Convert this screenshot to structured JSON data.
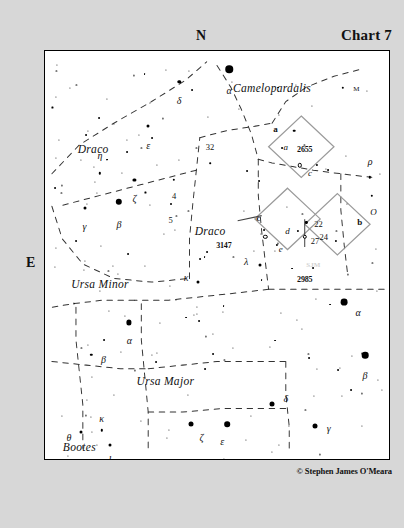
{
  "header": {
    "north_label": "N",
    "east_label": "E",
    "chart_title": "Chart 7"
  },
  "footer": {
    "copyright": "© Stephen James O'Meara"
  },
  "chart_data": {
    "type": "scatter",
    "title": "Chart 7",
    "subtitle": "",
    "xlabel": "",
    "ylabel": "",
    "grid": false,
    "legend": "none",
    "orientation": {
      "top": "N",
      "left": "E"
    },
    "constellations": [
      {
        "name": "Draco",
        "x": 14,
        "y": 24
      },
      {
        "name": "Camelopardalis",
        "x": 66,
        "y": 9
      },
      {
        "name": "Draco",
        "x": 48,
        "y": 44
      },
      {
        "name": "Ursa Minor",
        "x": 16,
        "y": 57
      },
      {
        "name": "Ursa Major",
        "x": 35,
        "y": 81
      },
      {
        "name": "Bootes",
        "x": 10,
        "y": 97
      }
    ],
    "stars": [
      {
        "label": "α",
        "x": 53.5,
        "y": 4.5,
        "mag": 7.5,
        "lx": 53.5,
        "ly": 9.5,
        "style": "greek"
      },
      {
        "label": "δ",
        "x": 39,
        "y": 7.5,
        "mag": 3.4,
        "lx": 39,
        "ly": 12.0,
        "style": "greek"
      },
      {
        "label": "M",
        "x": 86.5,
        "y": 9.0,
        "mag": 2.4,
        "lx": 90.5,
        "ly": 9.4,
        "style": "smallcap"
      },
      {
        "label": "ε",
        "x": 30,
        "y": 18.5,
        "mag": 3.0,
        "lx": 30,
        "ly": 23.0,
        "style": "greek"
      },
      {
        "label": "a",
        "x": 72.5,
        "y": 19.5,
        "mag": 2.6,
        "lx": 70.0,
        "ly": 23.5,
        "style": "ital"
      },
      {
        "label": "32",
        "x": 48,
        "y": 27.5,
        "mag": 1.6,
        "lx": 48,
        "ly": 23.5,
        "style": "num"
      },
      {
        "label": "η",
        "x": 16,
        "y": 30.0,
        "mag": 2.4,
        "lx": 16,
        "ly": 25.5,
        "style": "greek"
      },
      {
        "label": "ζ",
        "x": 26,
        "y": 31.5,
        "mag": 3.2,
        "lx": 26,
        "ly": 36.0,
        "style": "greek"
      },
      {
        "label": "4",
        "x": 37.5,
        "y": 31.5,
        "mag": 2.4,
        "lx": 37.5,
        "ly": 35.5,
        "style": "num"
      },
      {
        "label": "5",
        "x": 36.5,
        "y": 37.5,
        "mag": 2.0,
        "lx": 36.5,
        "ly": 41.5,
        "style": "num"
      },
      {
        "label": "γ",
        "x": 11.5,
        "y": 38.5,
        "mag": 3.0,
        "lx": 11.5,
        "ly": 43.0,
        "style": "greek"
      },
      {
        "label": "β",
        "x": 21.5,
        "y": 37.0,
        "mag": 6.4,
        "lx": 21.5,
        "ly": 42.5,
        "style": "greek"
      },
      {
        "label": "κ",
        "x": 44.5,
        "y": 56.5,
        "mag": 3.0,
        "lx": 41.0,
        "ly": 55.5,
        "style": "greek"
      },
      {
        "label": "λ",
        "x": 62.5,
        "y": 52.5,
        "mag": 3.0,
        "lx": 58.5,
        "ly": 51.5,
        "style": "greek"
      },
      {
        "label": "α",
        "x": 24.5,
        "y": 66.5,
        "mag": 5.2,
        "lx": 24.5,
        "ly": 70.8,
        "style": "greek"
      },
      {
        "label": "α",
        "x": 87,
        "y": 61.5,
        "mag": 6.8,
        "lx": 91.0,
        "ly": 64.0,
        "style": "greek"
      },
      {
        "label": "β",
        "x": 13.5,
        "y": 74.5,
        "mag": 2.4,
        "lx": 17.0,
        "ly": 75.5,
        "style": "greek"
      },
      {
        "label": "β",
        "x": 93,
        "y": 74.5,
        "mag": 6.6,
        "lx": 93.0,
        "ly": 79.5,
        "style": "greek"
      },
      {
        "label": "δ",
        "x": 66,
        "y": 86.5,
        "mag": 5.0,
        "lx": 70.0,
        "ly": 85.0,
        "style": "greek"
      },
      {
        "label": "ε",
        "x": 53,
        "y": 91.5,
        "mag": 5.6,
        "lx": 51.5,
        "ly": 95.5,
        "style": "greek"
      },
      {
        "label": "γ",
        "x": 78.5,
        "y": 92.0,
        "mag": 5.0,
        "lx": 82.5,
        "ly": 92.5,
        "style": "greek"
      },
      {
        "label": "ζ",
        "x": 42.5,
        "y": 91.5,
        "mag": 5.0,
        "lx": 45.5,
        "ly": 94.5,
        "style": "greek"
      },
      {
        "label": "θ",
        "x": 10.5,
        "y": 93.5,
        "mag": 3.0,
        "lx": 7.0,
        "ly": 94.5,
        "style": "greek"
      },
      {
        "label": "κ",
        "x": 16.5,
        "y": 93.0,
        "mag": 2.4,
        "lx": 16.5,
        "ly": 90.0,
        "style": "greek"
      },
      {
        "label": "ι",
        "x": 19.0,
        "y": 96.5,
        "mag": 3.0,
        "lx": 19.0,
        "ly": 99.5,
        "style": "greek"
      },
      {
        "label": "η",
        "x": 21.5,
        "y": 104.5,
        "mag": 5.2,
        "lx": 25.0,
        "ly": 106.0,
        "style": "greek"
      },
      {
        "label": "χ",
        "x": 82.5,
        "y": 104.0,
        "mag": 3.6,
        "lx": 86.5,
        "ly": 105.5,
        "style": "greek"
      },
      {
        "label": "ρ",
        "x": 94.5,
        "y": 31.0,
        "mag": 2.4,
        "lx": 94.5,
        "ly": 27.0,
        "style": "greek"
      },
      {
        "label": "O",
        "x": 95.0,
        "y": 35.5,
        "mag": 2.4,
        "lx": 95.5,
        "ly": 39.5,
        "style": "ital"
      }
    ],
    "detail_fields": [
      {
        "label": "a",
        "cx": 74.5,
        "cy": 26.5
      },
      {
        "label": "c",
        "cx": 70.5,
        "cy": 46.5
      },
      {
        "label": "b",
        "cx": 85.0,
        "cy": 48.0
      }
    ],
    "deep_sky_objects": [
      {
        "catalog": "2655",
        "x": 74.0,
        "y": 28.0,
        "lx": 75.5,
        "ly": 24.0
      },
      {
        "catalog": "3147",
        "x": 64.0,
        "y": 45.5,
        "lx": 52.0,
        "ly": 47.5
      },
      {
        "catalog": "2985",
        "x": 75.5,
        "y": 45.5,
        "lx": 75.5,
        "ly": 56.0
      }
    ],
    "field_stars": [
      {
        "label": "c",
        "x": 79.0,
        "y": 28.0,
        "lx": 77.0,
        "ly": 30.0,
        "style": "ital"
      },
      {
        "label": "d",
        "x": 73.5,
        "y": 44.0,
        "lx": 70.5,
        "ly": 44.0,
        "style": "ital"
      },
      {
        "label": "e",
        "x": 67.5,
        "y": 47.5,
        "lx": 68.5,
        "ly": 48.5,
        "style": "ital"
      },
      {
        "label": "22",
        "x": 76.0,
        "y": 42.0,
        "lx": 79.5,
        "ly": 42.5,
        "style": "num"
      },
      {
        "label": "27",
        "x": 75.5,
        "y": 45.5,
        "lx": 78.5,
        "ly": 46.5,
        "style": "num"
      },
      {
        "label": "24",
        "x": 84.5,
        "y": 46.5,
        "lx": 81.0,
        "ly": 45.5,
        "style": "num"
      }
    ]
  }
}
